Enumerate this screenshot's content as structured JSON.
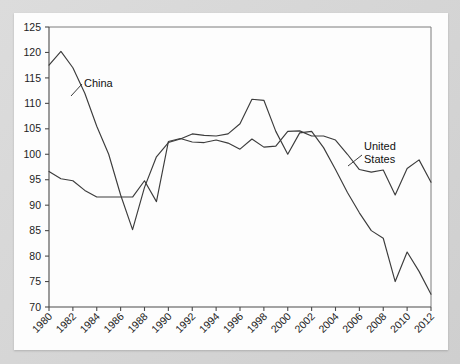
{
  "chart_data": {
    "type": "line",
    "title": "",
    "subtitle": "",
    "xlabel": "",
    "ylabel": "",
    "xlim": [
      1980,
      2012
    ],
    "ylim": [
      70,
      125
    ],
    "grid": false,
    "legend_position": "inline-annotations",
    "y_ticks": [
      70,
      75,
      80,
      85,
      90,
      95,
      100,
      105,
      110,
      115,
      120,
      125
    ],
    "x_ticks": [
      1980,
      1982,
      1984,
      1986,
      1988,
      1990,
      1992,
      1994,
      1996,
      1998,
      2000,
      2002,
      2004,
      2006,
      2008,
      2010,
      2012
    ],
    "x": [
      1980,
      1981,
      1982,
      1983,
      1984,
      1985,
      1986,
      1987,
      1988,
      1989,
      1990,
      1991,
      1992,
      1993,
      1994,
      1995,
      1996,
      1997,
      1998,
      1999,
      2000,
      2001,
      2002,
      2003,
      2004,
      2005,
      2006,
      2007,
      2008,
      2009,
      2010,
      2011,
      2012
    ],
    "series": [
      {
        "name": "China",
        "color": "#3c3c3c",
        "values": [
          117.5,
          120.2,
          117.0,
          112.0,
          105.5,
          100.0,
          92.0,
          85.2,
          93.5,
          99.5,
          102.3,
          103.0,
          104.0,
          103.7,
          103.6,
          104.0,
          106.0,
          110.8,
          110.6,
          104.5,
          100.0,
          104.2,
          104.5,
          101.3,
          97.0,
          92.5,
          88.5,
          85.0,
          83.5,
          75.0,
          80.8,
          77.0,
          72.5
        ]
      },
      {
        "name": "United States",
        "color": "#3c3c3c",
        "values": [
          96.6,
          95.2,
          94.8,
          92.9,
          91.6,
          91.6,
          91.6,
          91.6,
          94.8,
          90.7,
          102.5,
          103.1,
          102.4,
          102.3,
          102.8,
          102.2,
          101.0,
          103.0,
          101.4,
          101.6,
          104.5,
          104.6,
          103.6,
          103.6,
          102.8,
          100.0,
          97.0,
          96.5,
          96.9,
          92.0,
          97.2,
          98.9,
          94.5
        ]
      }
    ],
    "annotations": [
      {
        "text": "China",
        "name": "china-series-label"
      },
      {
        "text_line1": "United",
        "text_line2": "States",
        "name": "united-states-series-label"
      }
    ]
  },
  "annotations": {
    "china": "China",
    "united_states_line1": "United",
    "united_states_line2": "States"
  },
  "colors": {
    "background": "#d6d6d6",
    "card": "#fdfdfd",
    "axis": "#4a4a4a",
    "frame": "#7d7d7d",
    "line": "#3c3c3c",
    "text": "#1c1c1c"
  }
}
